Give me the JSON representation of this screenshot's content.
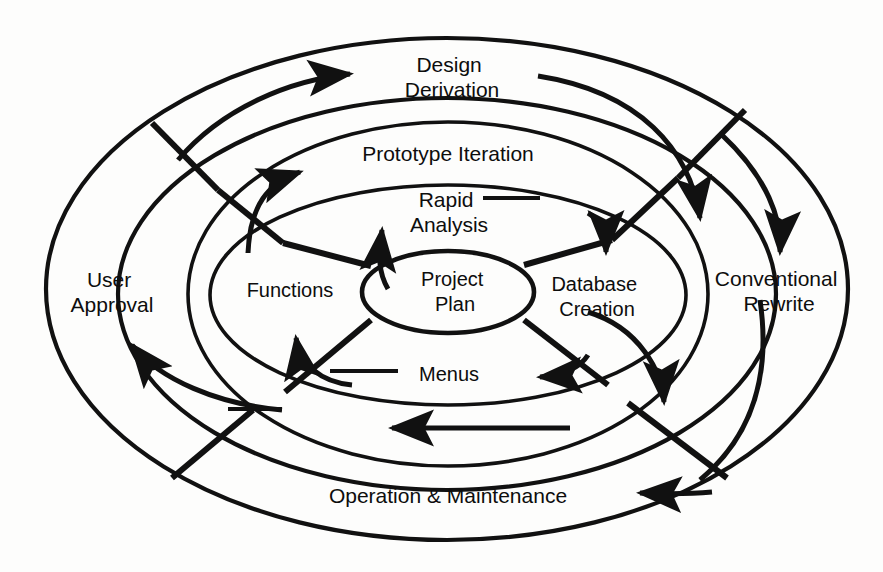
{
  "diagram": {
    "type": "concentric-ellipse-process-diagram",
    "background_color": "#fdfdfc",
    "line_color": "#111111",
    "text_color": "#0d0d0d",
    "core": {
      "label_line1": "Project",
      "label_line2": "Plan",
      "cx": 448,
      "cy": 292,
      "rx": 86,
      "ry": 41
    },
    "rings": [
      {
        "name": "ring-outer",
        "cx": 447,
        "cy": 289,
        "rx": 401,
        "ry": 251
      },
      {
        "name": "ring-second",
        "cx": 447,
        "cy": 294,
        "rx": 329,
        "ry": 196
      },
      {
        "name": "ring-third",
        "cx": 448,
        "cy": 294,
        "rx": 260,
        "ry": 172
      },
      {
        "name": "ring-fourth",
        "cx": 448,
        "cy": 295,
        "rx": 238,
        "ry": 110
      }
    ],
    "labels": [
      {
        "id": "design-derivation",
        "line1": "Design",
        "line2": "Derivation",
        "x": 452,
        "y": 82,
        "ring": "ring-outer"
      },
      {
        "id": "conventional-rewrite",
        "line1": "Conventional",
        "line2": "Rewrite",
        "x": 776,
        "y": 290,
        "ring": "ring-outer"
      },
      {
        "id": "operation-maintenance",
        "line1": "Operation & Maintenance",
        "line2": "",
        "x": 448,
        "y": 497,
        "ring": "ring-outer"
      },
      {
        "id": "user-approval",
        "line1": "User",
        "line2": "Approval",
        "x": 110,
        "y": 290,
        "ring": "ring-outer"
      },
      {
        "id": "prototype-iteration",
        "line1": "Prototype Iteration",
        "line2": "",
        "x": 448,
        "y": 155,
        "ring": "ring-second"
      },
      {
        "id": "rapid-analysis",
        "line1": "Rapid",
        "line2": "Analysis",
        "x": 448,
        "y": 215,
        "ring": "ring-third"
      },
      {
        "id": "functions",
        "line1": "Functions",
        "line2": "",
        "x": 290,
        "y": 292,
        "ring": "ring-fourth"
      },
      {
        "id": "database-creation",
        "line1": "Database",
        "line2": "Creation",
        "x": 597,
        "y": 295,
        "ring": "ring-fourth"
      },
      {
        "id": "menus",
        "line1": "Menus",
        "line2": "",
        "x": 449,
        "y": 376,
        "ring": "ring-fourth"
      }
    ],
    "arrow_count": 8,
    "arrows": [
      {
        "id": "arrow-design-derivation",
        "direction": "right",
        "target": "Design Derivation"
      },
      {
        "id": "arrow-prototype-iteration",
        "direction": "up-right",
        "target": "Prototype Iteration"
      },
      {
        "id": "arrow-rapid-analysis",
        "direction": "up",
        "target": "Rapid Analysis"
      },
      {
        "id": "arrow-database-creation",
        "direction": "down",
        "target": "Database Creation"
      },
      {
        "id": "arrow-conventional-rewrite",
        "direction": "down",
        "target": "Conventional Rewrite"
      },
      {
        "id": "arrow-inner-right-down",
        "direction": "down-right",
        "target": "Prototype Iteration ring"
      },
      {
        "id": "arrow-menus",
        "direction": "left",
        "target": "Menus"
      },
      {
        "id": "arrow-operation-maintenance",
        "direction": "left",
        "target": "Operation & Maintenance"
      },
      {
        "id": "arrow-functions",
        "direction": "up",
        "target": "Functions"
      },
      {
        "id": "arrow-user-approval",
        "direction": "up",
        "target": "User Approval"
      },
      {
        "id": "arrow-inner-ring-left",
        "direction": "left",
        "target": "inner ring return"
      }
    ]
  }
}
